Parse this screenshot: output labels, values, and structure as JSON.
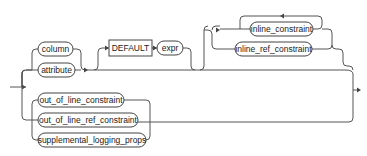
{
  "diagram": {
    "type": "syntax-railroad",
    "colors": {
      "line": "#555555",
      "node_border": "#444444",
      "text": "#222222",
      "background": "#ffffff"
    },
    "nodes": {
      "column": "column",
      "attribute": "attribute",
      "default_keyword": "DEFAULT",
      "expr": "expr",
      "inline_constraint": "inline_constraint",
      "inline_ref_constraint": "inline_ref_constraint",
      "out_of_line_constraint": "out_of_line_constraint",
      "out_of_line_ref_constraint": "out_of_line_ref_constraint",
      "supplemental_logging_props": "supplemental_logging_props"
    }
  }
}
